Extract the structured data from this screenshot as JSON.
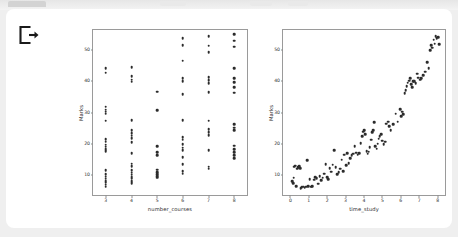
{
  "window": {
    "background_color": "#efefef",
    "card_color": "#ffffff",
    "tab_color": "#d3d3d3"
  },
  "toolbar": {
    "export_icon": "export-icon",
    "export_label": "Export"
  },
  "chart_data": [
    {
      "type": "scatter",
      "title": "",
      "xlabel": "number_courses",
      "ylabel": "Marks",
      "xlim": [
        2.5,
        8.5
      ],
      "ylim": [
        3.5,
        56.5
      ],
      "xticks": [
        3,
        4,
        5,
        6,
        7,
        8
      ],
      "yticks": [
        10,
        20,
        30,
        40,
        50
      ],
      "grid": false,
      "legend": "none",
      "marker_color": "#2b2b2b",
      "points": [
        [
          3,
          44.2
        ],
        [
          3,
          42.8
        ],
        [
          3,
          31.9
        ],
        [
          3,
          30.9
        ],
        [
          3,
          30.2
        ],
        [
          3,
          29.6
        ],
        [
          3,
          27.3
        ],
        [
          3,
          21.5
        ],
        [
          3,
          20.6
        ],
        [
          3,
          19.7
        ],
        [
          3,
          19.0
        ],
        [
          3,
          18.2
        ],
        [
          3,
          17.6
        ],
        [
          3,
          11.5
        ],
        [
          3,
          10.1
        ],
        [
          3,
          9.4
        ],
        [
          3,
          8.7
        ],
        [
          3,
          8.0
        ],
        [
          3,
          7.4
        ],
        [
          3,
          6.8
        ],
        [
          3,
          6.2
        ],
        [
          4,
          44.6
        ],
        [
          4,
          41.6
        ],
        [
          4,
          40.6
        ],
        [
          4,
          39.9
        ],
        [
          4,
          27.6
        ],
        [
          4,
          24.3
        ],
        [
          4,
          23.4
        ],
        [
          4,
          22.6
        ],
        [
          4,
          21.7
        ],
        [
          4,
          20.4
        ],
        [
          4,
          16.9
        ],
        [
          4,
          13.6
        ],
        [
          4,
          12.8
        ],
        [
          4,
          11.5
        ],
        [
          4,
          10.6
        ],
        [
          4,
          10.0
        ],
        [
          4,
          9.3
        ],
        [
          4,
          8.7
        ],
        [
          4,
          7.9
        ],
        [
          4,
          7.2
        ],
        [
          5,
          36.7
        ],
        [
          5,
          30.7
        ],
        [
          5,
          19.1
        ],
        [
          5,
          17.2
        ],
        [
          5,
          16.3
        ],
        [
          5,
          11.6
        ],
        [
          5,
          10.9
        ],
        [
          5,
          10.2
        ],
        [
          5,
          9.6
        ],
        [
          5,
          9.0
        ],
        [
          6,
          53.8
        ],
        [
          6,
          51.6
        ],
        [
          6,
          46.6
        ],
        [
          6,
          41.0
        ],
        [
          6,
          40.1
        ],
        [
          6,
          35.8
        ],
        [
          6,
          27.5
        ],
        [
          6,
          22.1
        ],
        [
          6,
          21.2
        ],
        [
          6,
          19.8
        ],
        [
          6,
          18.7
        ],
        [
          6,
          17.8
        ],
        [
          6,
          15.6
        ],
        [
          6,
          13.4
        ],
        [
          6,
          11.2
        ],
        [
          6,
          10.4
        ],
        [
          7,
          54.6
        ],
        [
          7,
          51.5
        ],
        [
          7,
          49.3
        ],
        [
          7,
          41.4
        ],
        [
          7,
          40.4
        ],
        [
          7,
          39.4
        ],
        [
          7,
          36.6
        ],
        [
          7,
          27.4
        ],
        [
          7,
          24.6
        ],
        [
          7,
          23.6
        ],
        [
          7,
          22.8
        ],
        [
          7,
          17.9
        ],
        [
          7,
          12.6
        ],
        [
          7,
          11.9
        ],
        [
          8,
          55.2
        ],
        [
          8,
          53.1
        ],
        [
          8,
          51.2
        ],
        [
          8,
          44.3
        ],
        [
          8,
          41.1
        ],
        [
          8,
          39.8
        ],
        [
          8,
          38.2
        ],
        [
          8,
          36.4
        ],
        [
          8,
          26.3
        ],
        [
          8,
          25.1
        ],
        [
          8,
          24.3
        ],
        [
          8,
          19.3
        ],
        [
          8,
          18.3
        ],
        [
          8,
          17.2
        ],
        [
          8,
          16.2
        ],
        [
          8,
          15.3
        ]
      ]
    },
    {
      "type": "scatter",
      "title": "",
      "xlabel": "time_study",
      "ylabel": "Marks",
      "xlim": [
        -0.4,
        8.4
      ],
      "ylim": [
        3.5,
        56.5
      ],
      "xticks": [
        0,
        1,
        2,
        3,
        4,
        5,
        6,
        7,
        8
      ],
      "yticks": [
        10,
        20,
        30,
        40,
        50
      ],
      "grid": false,
      "legend": "none",
      "marker_color": "#2b2b2b",
      "points": [
        [
          0.1,
          8.0
        ],
        [
          0.14,
          7.2
        ],
        [
          0.18,
          9.1
        ],
        [
          0.22,
          12.6
        ],
        [
          0.26,
          12.9
        ],
        [
          0.32,
          6.4
        ],
        [
          0.38,
          11.9
        ],
        [
          0.44,
          12.4
        ],
        [
          0.48,
          12.7
        ],
        [
          0.52,
          12.1
        ],
        [
          0.56,
          5.6
        ],
        [
          0.62,
          6.0
        ],
        [
          0.7,
          6.2
        ],
        [
          0.78,
          5.9
        ],
        [
          0.86,
          6.1
        ],
        [
          0.92,
          14.7
        ],
        [
          0.98,
          6.4
        ],
        [
          1.05,
          8.6
        ],
        [
          1.12,
          6.2
        ],
        [
          1.2,
          6.3
        ],
        [
          1.28,
          8.4
        ],
        [
          1.36,
          9.2
        ],
        [
          1.44,
          8.9
        ],
        [
          1.52,
          7.1
        ],
        [
          1.6,
          9.6
        ],
        [
          1.68,
          8.3
        ],
        [
          1.76,
          9.0
        ],
        [
          1.84,
          10.4
        ],
        [
          1.92,
          13.4
        ],
        [
          2.0,
          9.2
        ],
        [
          2.06,
          8.6
        ],
        [
          2.14,
          12.1
        ],
        [
          2.22,
          11.0
        ],
        [
          2.3,
          13.2
        ],
        [
          2.38,
          17.9
        ],
        [
          2.46,
          12.4
        ],
        [
          2.54,
          10.2
        ],
        [
          2.62,
          10.8
        ],
        [
          2.7,
          12.0
        ],
        [
          2.78,
          14.9
        ],
        [
          2.86,
          11.1
        ],
        [
          2.94,
          16.4
        ],
        [
          3.02,
          13.0
        ],
        [
          3.1,
          17.0
        ],
        [
          3.18,
          13.8
        ],
        [
          3.26,
          15.3
        ],
        [
          3.34,
          16.2
        ],
        [
          3.42,
          16.8
        ],
        [
          3.5,
          19.1
        ],
        [
          3.58,
          17.1
        ],
        [
          3.66,
          16.4
        ],
        [
          3.74,
          16.9
        ],
        [
          3.82,
          20.2
        ],
        [
          3.9,
          22.3
        ],
        [
          3.96,
          23.8
        ],
        [
          4.02,
          24.4
        ],
        [
          4.08,
          23.1
        ],
        [
          4.14,
          17.6
        ],
        [
          4.2,
          16.7
        ],
        [
          4.26,
          17.4
        ],
        [
          4.32,
          18.9
        ],
        [
          4.38,
          21.2
        ],
        [
          4.44,
          23.6
        ],
        [
          4.5,
          24.3
        ],
        [
          4.56,
          26.8
        ],
        [
          4.62,
          19.2
        ],
        [
          4.68,
          18.4
        ],
        [
          4.74,
          20.0
        ],
        [
          4.8,
          21.6
        ],
        [
          4.86,
          22.4
        ],
        [
          4.92,
          23.0
        ],
        [
          4.98,
          21.0
        ],
        [
          5.06,
          19.8
        ],
        [
          5.14,
          20.6
        ],
        [
          5.22,
          26.4
        ],
        [
          5.3,
          27.1
        ],
        [
          5.38,
          25.6
        ],
        [
          5.46,
          24.4
        ],
        [
          5.6,
          26.2
        ],
        [
          5.72,
          29.6
        ],
        [
          5.84,
          27.0
        ],
        [
          5.96,
          31.0
        ],
        [
          6.02,
          28.9
        ],
        [
          6.08,
          30.2
        ],
        [
          6.14,
          29.4
        ],
        [
          6.2,
          36.2
        ],
        [
          6.26,
          37.1
        ],
        [
          6.32,
          38.4
        ],
        [
          6.38,
          39.6
        ],
        [
          6.44,
          40.2
        ],
        [
          6.5,
          41.1
        ],
        [
          6.56,
          39.0
        ],
        [
          6.62,
          38.2
        ],
        [
          6.68,
          40.0
        ],
        [
          6.74,
          40.1
        ],
        [
          6.8,
          39.4
        ],
        [
          6.88,
          42.4
        ],
        [
          6.96,
          41.2
        ],
        [
          7.04,
          40.6
        ],
        [
          7.12,
          41.0
        ],
        [
          7.22,
          42.0
        ],
        [
          7.32,
          43.1
        ],
        [
          7.42,
          46.2
        ],
        [
          7.52,
          44.2
        ],
        [
          7.6,
          50.1
        ],
        [
          7.66,
          51.6
        ],
        [
          7.72,
          50.8
        ],
        [
          7.78,
          53.4
        ],
        [
          7.84,
          52.1
        ],
        [
          7.9,
          54.6
        ],
        [
          7.96,
          53.8
        ],
        [
          8.02,
          54.2
        ],
        [
          8.08,
          51.9
        ]
      ]
    }
  ]
}
